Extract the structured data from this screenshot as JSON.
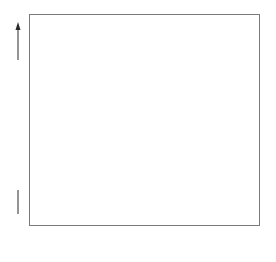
{
  "chart_data": {
    "type": "scatter",
    "title": "",
    "xlabel": "",
    "ylabel": "Plasma TSH concentration",
    "y_axis_has_arrow": true,
    "y_ticks": [],
    "ylim": [
      0,
      100
    ],
    "grid": false,
    "legend": null,
    "categories": [
      "Normal",
      "Group A",
      "Group B"
    ],
    "series": [
      {
        "name": "Normal",
        "points": [
          {
            "x": 56,
            "y": 11
          },
          {
            "x": 63,
            "y": 11
          },
          {
            "x": 71,
            "y": 11
          },
          {
            "x": 57,
            "y": 8
          },
          {
            "x": 63,
            "y": 9
          },
          {
            "x": 71,
            "y": 7
          },
          {
            "x": 50,
            "y": 5
          },
          {
            "x": 57,
            "y": 5
          },
          {
            "x": 67,
            "y": 5
          },
          {
            "x": 62,
            "y": 3
          }
        ]
      },
      {
        "name": "Group A",
        "points": [
          {
            "x": 136,
            "y": 87
          },
          {
            "x": 146,
            "y": 77
          },
          {
            "x": 143,
            "y": 69
          },
          {
            "x": 138,
            "y": 65
          },
          {
            "x": 147,
            "y": 56
          },
          {
            "x": 131,
            "y": 50
          },
          {
            "x": 139,
            "y": 41
          },
          {
            "x": 150,
            "y": 40
          },
          {
            "x": 145,
            "y": 29
          },
          {
            "x": 140,
            "y": 25
          },
          {
            "x": 137,
            "y": 13
          },
          {
            "x": 144,
            "y": 10
          }
        ]
      },
      {
        "name": "Group B",
        "points": [
          {
            "x": 216,
            "y": 2
          },
          {
            "x": 223,
            "y": 5
          },
          {
            "x": 223,
            "y": 2
          },
          {
            "x": 229,
            "y": 2
          },
          {
            "x": 235,
            "y": 3
          },
          {
            "x": 240,
            "y": 2
          },
          {
            "x": 245,
            "y": 3
          }
        ]
      }
    ]
  },
  "labels": {
    "x": [
      {
        "text": "Normal",
        "cx": 61
      },
      {
        "text": "Group A",
        "cx": 143
      },
      {
        "text": "Group B",
        "cx": 229
      }
    ],
    "y": "Plasma TSH concentration"
  },
  "colors": {
    "dot": "#111111",
    "frame": "#7a7a7a",
    "text": "#2a2a2a"
  }
}
